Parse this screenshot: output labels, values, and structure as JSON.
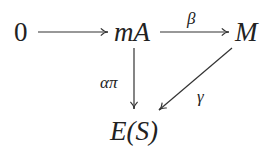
{
  "diagram": {
    "type": "commutative-diagram",
    "nodes": {
      "zero": "0",
      "mA": "mA",
      "M": "M",
      "ES": "E(S)"
    },
    "arrows": {
      "zero_to_mA": "",
      "mA_to_M": "β",
      "mA_to_ES": "απ",
      "M_to_ES": "γ"
    },
    "colors": {
      "ink": "#222222",
      "background": "#ffffff"
    }
  }
}
